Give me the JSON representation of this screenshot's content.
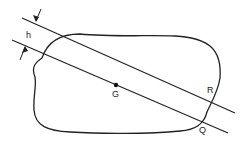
{
  "diagram": {
    "labels": {
      "h": "h",
      "G": "G",
      "R": "R",
      "Q": "Q"
    },
    "stroke_color": "#222222",
    "background": "#ffffff"
  }
}
